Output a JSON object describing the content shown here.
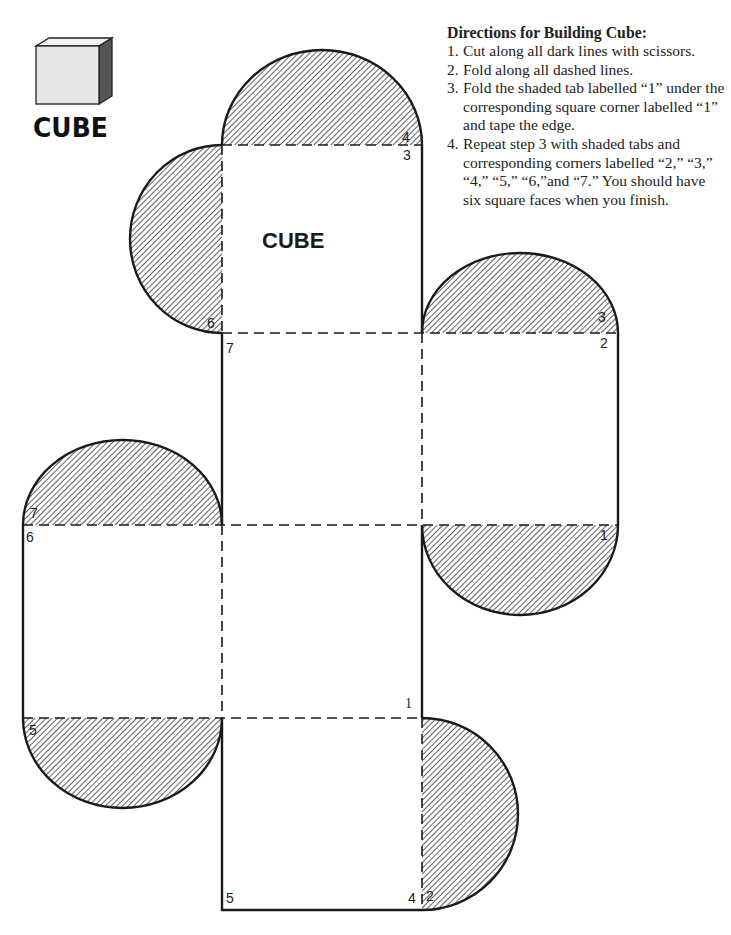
{
  "logo": {
    "word": "CUBE",
    "icon": "cube-icon"
  },
  "directions": {
    "title": "Directions for Building Cube:",
    "steps": [
      {
        "num": "1.",
        "text": "Cut along all dark lines with scissors."
      },
      {
        "num": "2.",
        "text": "Fold along all dashed lines."
      },
      {
        "num": "3.",
        "text": "Fold the shaded tab labelled “1” under the corresponding square corner labelled “1”  and tape the edge."
      },
      {
        "num": "4.",
        "text": "Repeat step 3 with shaded tabs and corresponding corners labelled “2,” “3,” “4,” “5,” “6,”and “7.” You should have six square faces when you finish."
      }
    ]
  },
  "net": {
    "face_title": "CUBE",
    "faces": [
      "top",
      "left-side",
      "right-side",
      "middle",
      "bottom",
      "back"
    ],
    "labels": {
      "tab_top": "4",
      "corner_top_right": "3",
      "tab_left_top": "6",
      "corner_top_left": "7",
      "tab_right_top": "3",
      "corner_right_top": "2",
      "tab_right_bottom": "1",
      "tab_left_face_top": "7",
      "corner_left_face_top": "6",
      "tab_left_face_bottom": "5",
      "corner_middle_bottom_right": "1",
      "corner_bottom_left": "5",
      "corner_bottom_right": "4",
      "tab_bottom_right": "2"
    },
    "colors": {
      "line": "#1a1a1a",
      "hatch": "#333333",
      "paper": "#ffffff"
    }
  }
}
